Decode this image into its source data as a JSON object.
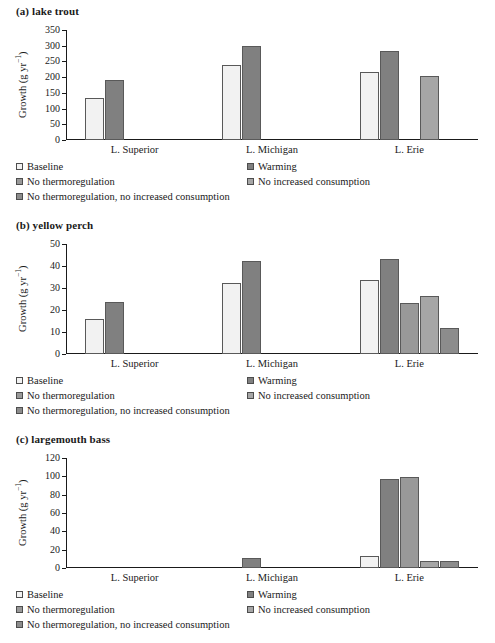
{
  "figure": {
    "axis_label": "Growth (g yr",
    "axis_label_sup": "−1",
    "axis_label_tail": ")",
    "categories": [
      "L. Superior",
      "L. Michigan",
      "L. Erie"
    ],
    "series_names": [
      "Baseline",
      "Warming",
      "No thermoregulation",
      "No increased consumption",
      "No thermoregulation, no increased consumption"
    ],
    "series_colors": [
      "#f2f2f2",
      "#808080",
      "#999999",
      "#a6a6a6",
      "#8c8c8c"
    ],
    "bar_border_color": "#595959"
  },
  "panels": [
    {
      "title": "(a) lake trout",
      "ylabel": "Growth (g yr−1)",
      "ticks": [
        0,
        50,
        100,
        150,
        200,
        250,
        300,
        350
      ],
      "ymax": 350
    },
    {
      "title": "(b) yellow perch",
      "ylabel": "Growth (g yr−1)",
      "ticks": [
        0,
        10,
        20,
        30,
        40,
        50
      ],
      "ymax": 50
    },
    {
      "title": "(c) largemouth bass",
      "ylabel": "Growth (g yr−1)",
      "ticks": [
        0,
        20,
        40,
        60,
        80,
        100,
        120
      ],
      "ymax": 120
    }
  ],
  "legend": {
    "items": [
      {
        "label": "Baseline",
        "color": "#f2f2f2"
      },
      {
        "label": "Warming",
        "color": "#808080"
      },
      {
        "label": "No thermoregulation",
        "color": "#999999"
      },
      {
        "label": "No increased consumption",
        "color": "#a6a6a6"
      },
      {
        "label": "No thermoregulation, no increased consumption",
        "color": "#8c8c8c"
      }
    ]
  },
  "chart_data": [
    {
      "type": "bar",
      "title": "(a) lake trout",
      "xlabel": "",
      "ylabel": "Growth (g yr−1)",
      "ylim": [
        0,
        350
      ],
      "yticks": [
        0,
        50,
        100,
        150,
        200,
        250,
        300,
        350
      ],
      "grid": false,
      "legend_position": "below",
      "categories": [
        "L. Superior",
        "L. Michigan",
        "L. Erie"
      ],
      "series": [
        {
          "name": "Baseline",
          "values": [
            133,
            238,
            215
          ]
        },
        {
          "name": "Warming",
          "values": [
            192,
            298,
            284
          ]
        },
        {
          "name": "No thermoregulation",
          "values": [
            null,
            null,
            null
          ]
        },
        {
          "name": "No increased consumption",
          "values": [
            null,
            null,
            205
          ]
        },
        {
          "name": "No thermoregulation, no increased consumption",
          "values": [
            null,
            null,
            null
          ]
        }
      ]
    },
    {
      "type": "bar",
      "title": "(b) yellow perch",
      "xlabel": "",
      "ylabel": "Growth (g yr−1)",
      "ylim": [
        0,
        50
      ],
      "yticks": [
        0,
        10,
        20,
        30,
        40,
        50
      ],
      "grid": false,
      "legend_position": "below",
      "categories": [
        "L. Superior",
        "L. Michigan",
        "L. Erie"
      ],
      "series": [
        {
          "name": "Baseline",
          "values": [
            16,
            32.3,
            33.5
          ]
        },
        {
          "name": "Warming",
          "values": [
            23.7,
            42.2,
            43
          ]
        },
        {
          "name": "No thermoregulation",
          "values": [
            null,
            null,
            23.4
          ]
        },
        {
          "name": "No increased consumption",
          "values": [
            null,
            null,
            26.4
          ]
        },
        {
          "name": "No thermoregulation, no increased consumption",
          "values": [
            null,
            null,
            11.6
          ]
        }
      ]
    },
    {
      "type": "bar",
      "title": "(c) largemouth bass",
      "xlabel": "",
      "ylabel": "Growth (g yr−1)",
      "ylim": [
        0,
        120
      ],
      "yticks": [
        0,
        20,
        40,
        60,
        80,
        100,
        120
      ],
      "grid": false,
      "legend_position": "below",
      "categories": [
        "L. Superior",
        "L. Michigan",
        "L. Erie"
      ],
      "series": [
        {
          "name": "Baseline",
          "values": [
            null,
            null,
            13
          ]
        },
        {
          "name": "Warming",
          "values": [
            null,
            11,
            97
          ]
        },
        {
          "name": "No thermoregulation",
          "values": [
            null,
            null,
            99
          ]
        },
        {
          "name": "No increased consumption",
          "values": [
            null,
            null,
            8
          ]
        },
        {
          "name": "No thermoregulation, no increased consumption",
          "values": [
            null,
            null,
            7.5
          ]
        }
      ]
    }
  ]
}
